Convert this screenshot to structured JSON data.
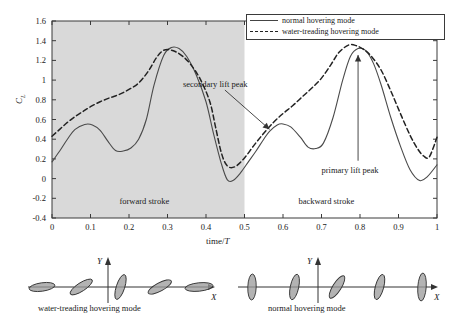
{
  "chart_data": {
    "type": "line",
    "title": "",
    "xlabel": "time/T",
    "ylabel": "CL",
    "xlim": [
      0,
      1
    ],
    "ylim": [
      -0.4,
      1.6
    ],
    "xticks": [
      "0",
      "0.1",
      "0.2",
      "0.3",
      "0.4",
      "0.5",
      "0.6",
      "0.7",
      "0.8",
      "0.9",
      "1"
    ],
    "xtick_values": [
      0,
      0.1,
      0.2,
      0.3,
      0.4,
      0.5,
      0.6,
      0.7,
      0.8,
      0.9,
      1
    ],
    "yticks": [
      "1.6",
      "1.4",
      "1.2",
      "1",
      "0.8",
      "0.6",
      "0.4",
      "0.2",
      "0",
      "-0.2",
      "-0.4"
    ],
    "ytick_values": [
      1.6,
      1.4,
      1.2,
      1.0,
      0.8,
      0.6,
      0.4,
      0.2,
      0,
      -0.2,
      -0.4
    ],
    "grid": false,
    "legend_position": "top-right",
    "shaded_region": {
      "x_start": 0,
      "x_end": 0.5,
      "color": "#d9d9d9"
    },
    "series": [
      {
        "name": "normal hovering mode",
        "style": "solid",
        "color": "#4a4a4a",
        "x": [
          0,
          0.02,
          0.04,
          0.06,
          0.085,
          0.105,
          0.125,
          0.145,
          0.165,
          0.185,
          0.205,
          0.225,
          0.245,
          0.265,
          0.29,
          0.31,
          0.33,
          0.35,
          0.375,
          0.4,
          0.42,
          0.44,
          0.455,
          0.47,
          0.49,
          0.51,
          0.53,
          0.55,
          0.565,
          0.585,
          0.6,
          0.62,
          0.645,
          0.665,
          0.685,
          0.705,
          0.73,
          0.755,
          0.775,
          0.795,
          0.815,
          0.835,
          0.855,
          0.88,
          0.905,
          0.93,
          0.955,
          0.975,
          1.0
        ],
        "y": [
          0.17,
          0.28,
          0.4,
          0.5,
          0.55,
          0.545,
          0.49,
          0.38,
          0.285,
          0.28,
          0.31,
          0.4,
          0.6,
          0.95,
          1.25,
          1.33,
          1.32,
          1.24,
          1.05,
          0.78,
          0.45,
          0.15,
          -0.01,
          -0.02,
          0.06,
          0.17,
          0.28,
          0.4,
          0.48,
          0.545,
          0.555,
          0.525,
          0.42,
          0.32,
          0.305,
          0.36,
          0.62,
          1.0,
          1.24,
          1.32,
          1.3,
          1.17,
          0.95,
          0.62,
          0.33,
          0.09,
          -0.02,
          0.02,
          0.14
        ]
      },
      {
        "name": "water-treading hovering mode",
        "style": "dashed",
        "color": "#222222",
        "x": [
          0,
          0.02,
          0.04,
          0.06,
          0.08,
          0.1,
          0.125,
          0.15,
          0.175,
          0.2,
          0.225,
          0.25,
          0.27,
          0.285,
          0.3,
          0.32,
          0.34,
          0.36,
          0.385,
          0.41,
          0.425,
          0.44,
          0.455,
          0.475,
          0.5,
          0.525,
          0.55,
          0.575,
          0.6,
          0.625,
          0.65,
          0.675,
          0.7,
          0.725,
          0.745,
          0.77,
          0.79,
          0.81,
          0.83,
          0.855,
          0.88,
          0.905,
          0.93,
          0.95,
          0.965,
          0.98,
          1.0
        ],
        "y": [
          0.43,
          0.5,
          0.57,
          0.63,
          0.68,
          0.73,
          0.78,
          0.82,
          0.855,
          0.905,
          0.97,
          1.09,
          1.22,
          1.29,
          1.31,
          1.29,
          1.24,
          1.16,
          1.01,
          0.78,
          0.52,
          0.26,
          0.13,
          0.12,
          0.21,
          0.34,
          0.46,
          0.57,
          0.66,
          0.74,
          0.83,
          0.92,
          1.02,
          1.16,
          1.28,
          1.355,
          1.35,
          1.31,
          1.24,
          1.1,
          0.89,
          0.66,
          0.44,
          0.3,
          0.23,
          0.22,
          0.42
        ]
      }
    ],
    "annotations": [
      {
        "id": "secondary-lift-peak",
        "text": "secondary lift  peak",
        "point": [
          0.565,
          0.5
        ],
        "label_pos": [
          0.34,
          0.95
        ]
      },
      {
        "id": "primary-lift-peak",
        "text": "primary lift peak",
        "point": [
          0.795,
          1.255
        ],
        "label_pos": [
          0.7,
          0.08
        ]
      },
      {
        "id": "forward-stroke",
        "text": "forward stroke",
        "label_pos": [
          0.175,
          -0.235
        ]
      },
      {
        "id": "backward-stroke",
        "text": "backward stroke",
        "label_pos": [
          0.64,
          -0.235
        ]
      }
    ]
  },
  "axes": {
    "y_label_main": "C",
    "y_label_sub": "L",
    "x_label_plain": "time/",
    "x_label_italic": "T"
  },
  "legend": {
    "items": [
      {
        "label": "normal hovering mode",
        "style": "solid"
      },
      {
        "label": "water-treading hovering mode",
        "style": "dashed"
      }
    ]
  },
  "stroke_diagrams": [
    {
      "id": "water-treading-hovering-mode",
      "caption": "water-treading hovering mode",
      "axis_x_label": "X",
      "axis_y_label": "Y",
      "wing_angles_deg": [
        8,
        33,
        72,
        28,
        6
      ],
      "wing_lengths": [
        26,
        26,
        26,
        26,
        28
      ]
    },
    {
      "id": "normal-hovering-mode",
      "caption": "normal hovering mode",
      "axis_x_label": "X",
      "axis_y_label": "Y",
      "wing_angles_deg": [
        88,
        78,
        58,
        75,
        86
      ],
      "wing_lengths": [
        26,
        26,
        26,
        26,
        28
      ]
    }
  ],
  "colors": {
    "shade": "#d9d9d9",
    "axis": "#3a3a3a",
    "solid_curve": "#4a4a4a",
    "dashed_curve": "#222222",
    "wing_fill": "#9a9a9a",
    "wing_stroke": "#333333"
  }
}
